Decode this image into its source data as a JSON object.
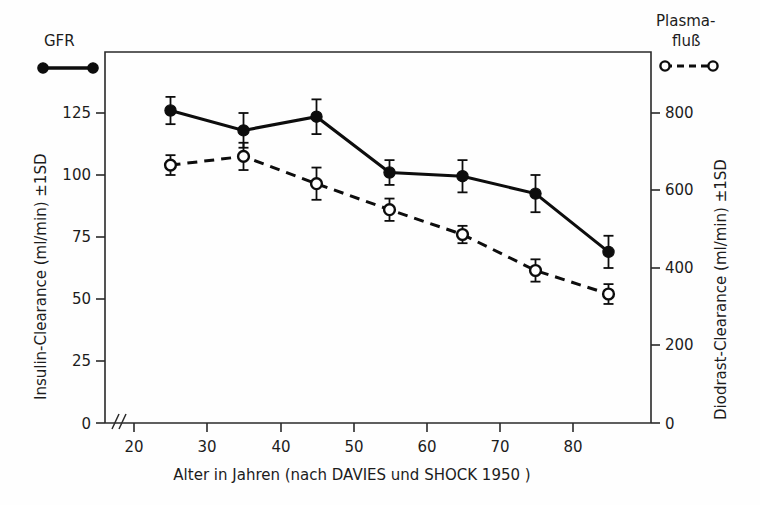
{
  "figure": {
    "background_color": "#fefefe",
    "ink_color": "#0d0d0d"
  },
  "legends": [
    {
      "name": "gfr",
      "label": "GFR",
      "marker": "filled-circle",
      "line_style": "solid"
    },
    {
      "name": "plasmafluss",
      "label_line1": "Plasma-",
      "label_line2": "fluß",
      "marker": "open-circle",
      "line_style": "dashed"
    }
  ],
  "axes": {
    "left": {
      "title": "Insulin-Clearance (ml/min) ±1SD",
      "ticks": [
        "0",
        "25",
        "50",
        "75",
        "100",
        "125"
      ],
      "tick_values": [
        0,
        25,
        50,
        75,
        100,
        125
      ],
      "has_break": true
    },
    "right": {
      "title": "Diodrast-Clearance (ml/min) ±1SD",
      "ticks": [
        "0",
        "200",
        "400",
        "600",
        "800"
      ],
      "tick_values": [
        0,
        200,
        400,
        600,
        800
      ]
    },
    "bottom": {
      "title": "Alter in Jahren (nach DAVIES und SHOCK 1950 )",
      "ticks": [
        "20",
        "30",
        "40",
        "50",
        "60",
        "70",
        "80"
      ],
      "tick_values": [
        20,
        30,
        40,
        50,
        60,
        70,
        80
      ],
      "has_break": true
    }
  },
  "chart_data": {
    "type": "line",
    "title": "",
    "xlabel": "Alter in Jahren (nach DAVIES und SHOCK 1950 )",
    "ylabel": "Insulin-Clearance (ml/min) ±1SD",
    "ylabel_right": "Diodrast-Clearance (ml/min) ±1SD",
    "x": [
      25,
      35,
      45,
      55,
      65,
      75,
      85
    ],
    "xlim": [
      20,
      88
    ],
    "ylim": [
      0,
      150
    ],
    "ylim_right": [
      0,
      960
    ],
    "grid": false,
    "legend_position": "outside-top-left-and-top-right",
    "series": [
      {
        "name": "GFR",
        "axis": "left",
        "marker": "filled-circle",
        "line_style": "solid",
        "values": [
          126,
          118,
          123.5,
          101,
          99.5,
          92.5,
          69
        ],
        "errors": [
          5.5,
          7,
          7,
          5,
          6.5,
          7.5,
          6.5
        ]
      },
      {
        "name": "Plasmafluß",
        "axis": "right",
        "marker": "open-circle",
        "line_style": "dashed",
        "values_left_scale": [
          104,
          107.5,
          96.5,
          86,
          76,
          61.5,
          52
        ],
        "values": [
          666,
          688,
          618,
          550,
          486,
          394,
          333
        ],
        "errors_left_scale": [
          4,
          5.5,
          6.5,
          4.5,
          3.5,
          4.5,
          4
        ]
      }
    ]
  }
}
